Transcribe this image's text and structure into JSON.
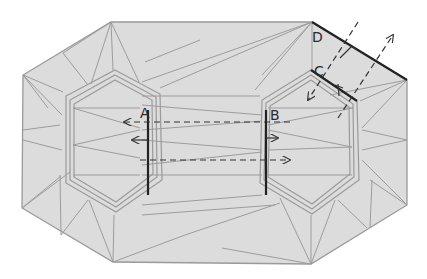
{
  "diagram": {
    "title": "",
    "colors": {
      "fill": "#dcdcdc",
      "crease": "#9a9a9a",
      "edge": "#222222",
      "arrow": "#333333"
    },
    "labels": {
      "A": "A",
      "B": "B",
      "C": "C",
      "D": "D"
    }
  }
}
